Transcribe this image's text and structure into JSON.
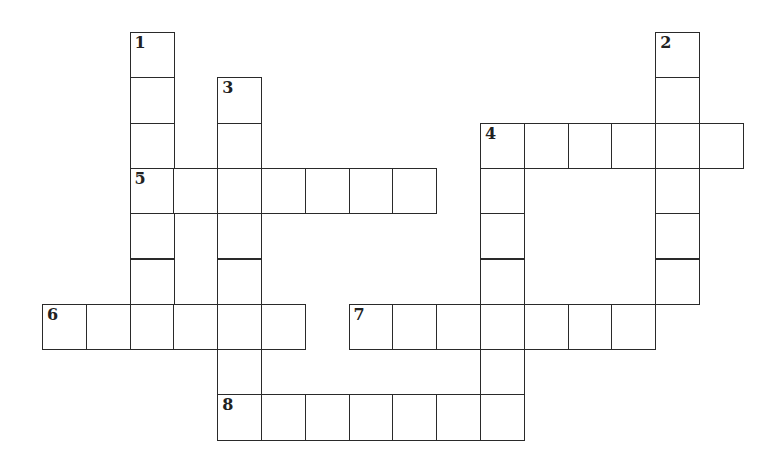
{
  "puzzle": {
    "cell_size": 43.8,
    "origin_x": 42,
    "origin_y": 32,
    "row_height": 45.3,
    "border_color": "#2a2a2a",
    "entries": [
      {
        "number": "1",
        "direction": "down",
        "row": 0,
        "col": 2,
        "length": 7
      },
      {
        "number": "2",
        "direction": "down",
        "row": 0,
        "col": 14,
        "length": 6
      },
      {
        "number": "3",
        "direction": "down",
        "row": 1,
        "col": 4,
        "length": 8
      },
      {
        "number": "4",
        "direction": "across",
        "row": 2,
        "col": 10,
        "length": 6
      },
      {
        "number": "",
        "direction": "down",
        "row": 2,
        "col": 10,
        "length": 7
      },
      {
        "number": "5",
        "direction": "across",
        "row": 3,
        "col": 2,
        "length": 7
      },
      {
        "number": "6",
        "direction": "across",
        "row": 6,
        "col": 0,
        "length": 6
      },
      {
        "number": "7",
        "direction": "across",
        "row": 6,
        "col": 7,
        "length": 7
      },
      {
        "number": "8",
        "direction": "across",
        "row": 8,
        "col": 4,
        "length": 7
      }
    ]
  }
}
